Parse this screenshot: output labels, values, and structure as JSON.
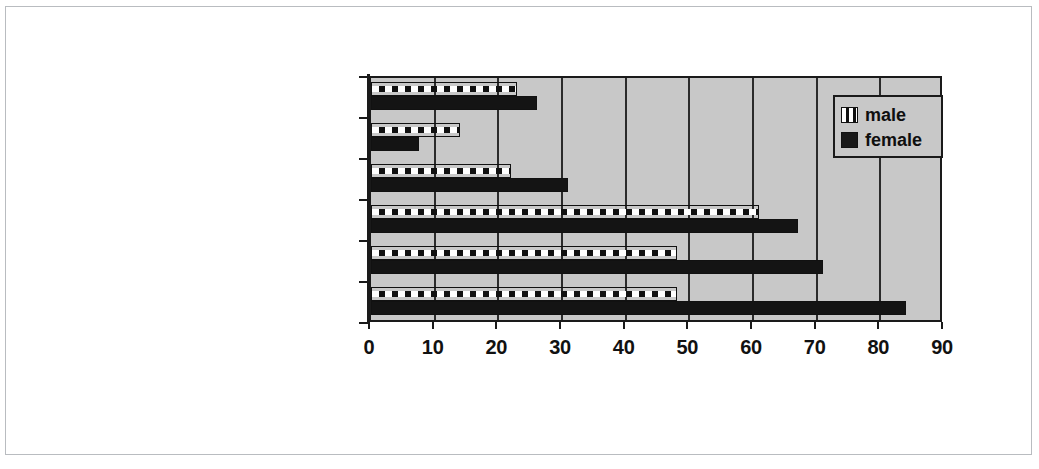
{
  "figure": {
    "background_color": "#ffffff",
    "frame_color": "#b9bcc0",
    "plot_background_color": "#c8c8c8",
    "axis_color": "#1a1a1a"
  },
  "legend": {
    "position": "top-right-inside",
    "entries": [
      {
        "label": "male",
        "swatch": "white-striped-on-black",
        "color": "#ffffff"
      },
      {
        "label": "female",
        "swatch": "solid-black",
        "color": "#141414"
      }
    ]
  },
  "chart_data": {
    "type": "bar",
    "orientation": "horizontal",
    "title": "",
    "subtitle": "",
    "xlabel": "",
    "ylabel": "",
    "xlim": [
      0,
      90
    ],
    "xticks": [
      0,
      10,
      20,
      30,
      40,
      50,
      60,
      70,
      80,
      90
    ],
    "xtick_labels": [
      "0",
      "10",
      "20",
      "30",
      "40",
      "50",
      "60",
      "70",
      "80",
      "90"
    ],
    "grid": true,
    "grid_axis": "x",
    "legend_position": "upper right",
    "categories": [
      "Aboriginal respondents",
      "disadvantaged youth services",
      "working class government school",
      "Middle class government school",
      "Catholic college",
      "Protestant college"
    ],
    "series": [
      {
        "name": "male",
        "color": "#ffffff",
        "pattern": "white-blocks-on-black",
        "values": [
          23,
          14,
          22,
          61,
          48,
          48
        ]
      },
      {
        "name": "female",
        "color": "#141414",
        "pattern": "solid",
        "values": [
          26,
          7.5,
          31,
          67,
          71,
          84
        ]
      }
    ]
  }
}
